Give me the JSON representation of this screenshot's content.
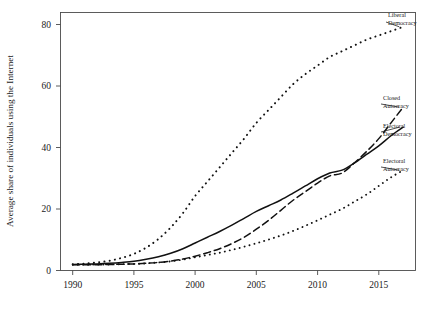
{
  "chart_data": {
    "type": "line",
    "title": "",
    "xlabel": "",
    "ylabel": "Average share of individuals using the Internet",
    "xlim": [
      1989,
      2018
    ],
    "ylim": [
      -2,
      88
    ],
    "xticks": [
      "1990",
      "1995",
      "2000",
      "2005",
      "2010",
      "2015"
    ],
    "xtick_values": [
      1990,
      1995,
      2000,
      2005,
      2010,
      2015
    ],
    "yticks": [
      "0",
      "20",
      "40",
      "60",
      "80"
    ],
    "ytick_values": [
      0,
      20,
      40,
      60,
      80
    ],
    "grid": false,
    "legend_position": "right-inline-annotations",
    "x": [
      1990,
      1991,
      1992,
      1993,
      1994,
      1995,
      1996,
      1997,
      1998,
      1999,
      2000,
      2001,
      2002,
      2003,
      2004,
      2005,
      2006,
      2007,
      2008,
      2009,
      2010,
      2011,
      2012,
      2013,
      2014,
      2015,
      2016,
      2017
    ],
    "series": [
      {
        "name": "Liberal Democracy",
        "style": "dotted",
        "label_line1": "Liberal",
        "label_line2": "Democracy",
        "values": [
          0.2,
          0.4,
          0.8,
          1.4,
          2.4,
          3.8,
          6.0,
          9.0,
          13.0,
          18.0,
          24.0,
          29.0,
          34.0,
          39.0,
          44.0,
          49.5,
          54.0,
          58.5,
          63.0,
          66.5,
          69.5,
          72.5,
          74.5,
          76.5,
          78.5,
          80.0,
          81.5,
          83.0
        ]
      },
      {
        "name": "Closed Autocracy",
        "style": "dashed",
        "label_line1": "Closed",
        "label_line2": "Autocracy",
        "values": [
          0.0,
          0.0,
          0.0,
          0.1,
          0.2,
          0.3,
          0.5,
          0.8,
          1.3,
          2.0,
          3.0,
          4.2,
          5.6,
          7.4,
          9.6,
          12.4,
          15.5,
          19.0,
          22.5,
          25.5,
          28.5,
          31.0,
          32.0,
          35.5,
          39.5,
          44.0,
          49.5,
          55.0
        ]
      },
      {
        "name": "Electoral Democracy",
        "style": "solid",
        "label_line1": "Electoral",
        "label_line2": "Democracy",
        "values": [
          0.1,
          0.2,
          0.3,
          0.5,
          0.8,
          1.2,
          1.9,
          2.8,
          4.0,
          5.6,
          7.6,
          9.6,
          11.6,
          13.8,
          16.2,
          18.6,
          20.6,
          22.6,
          25.0,
          27.5,
          30.0,
          32.0,
          33.0,
          35.5,
          38.5,
          41.5,
          45.0,
          48.0
        ]
      },
      {
        "name": "Electoral Autocracy",
        "style": "dotted",
        "label_line1": "Electoral",
        "label_line2": "Autocracy",
        "values": [
          0.0,
          0.0,
          0.1,
          0.1,
          0.2,
          0.3,
          0.5,
          0.8,
          1.2,
          1.8,
          2.6,
          3.4,
          4.2,
          5.2,
          6.3,
          7.5,
          8.8,
          10.2,
          11.8,
          13.6,
          15.5,
          17.5,
          19.5,
          22.0,
          24.5,
          27.5,
          30.5,
          33.0
        ]
      }
    ]
  }
}
